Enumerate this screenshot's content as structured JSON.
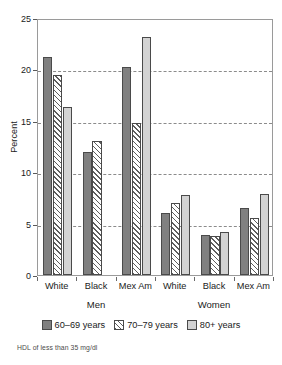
{
  "chart_data": {
    "type": "bar",
    "title": "",
    "xlabel": "",
    "ylabel": "Percent",
    "ylim": [
      0,
      25
    ],
    "yticks": [
      0,
      5,
      10,
      15,
      20,
      25
    ],
    "grid": true,
    "gridlines_at": [
      5,
      10,
      15,
      20
    ],
    "legend_position": "bottom",
    "categories": [
      "White",
      "Black",
      "Mex Am",
      "White",
      "Black",
      "Mex Am"
    ],
    "supergroups": [
      {
        "label": "Men",
        "categories": [
          "White",
          "Black",
          "Mex Am"
        ]
      },
      {
        "label": "Women",
        "categories": [
          "White",
          "Black",
          "Mex Am"
        ]
      }
    ],
    "series": [
      {
        "name": "60–69 years",
        "color": "#808080",
        "pattern": "solid",
        "values": [
          21.2,
          12.0,
          20.2,
          6.0,
          3.9,
          6.5
        ]
      },
      {
        "name": "70–79 years",
        "color": "#ffffff",
        "pattern": "hatch",
        "values": [
          19.5,
          13.0,
          14.8,
          7.0,
          3.8,
          5.5
        ]
      },
      {
        "name": "80+ years",
        "color": "#d3d3d3",
        "pattern": "solid",
        "values": [
          16.3,
          0.0,
          23.2,
          7.8,
          4.2,
          7.9
        ]
      }
    ],
    "annotations": [
      "HDL of less than 35 mg/dl"
    ]
  },
  "axis": {
    "ylabel": "Percent",
    "ytick_labels": [
      "0",
      "5",
      "10",
      "15",
      "20",
      "25"
    ]
  },
  "legend": {
    "items": [
      {
        "label": "60–69 years"
      },
      {
        "label": "70–79 years"
      },
      {
        "label": "80+ years"
      }
    ]
  },
  "footnote": {
    "text": "HDL of less than 35 mg/dl"
  },
  "colors": {
    "series_60_69": "#808080",
    "series_70_79": "#ffffff",
    "series_80_plus": "#d3d3d3",
    "axis": "#9a9a9a",
    "grid": "#8b8b8b",
    "text": "#1a1a1a"
  }
}
